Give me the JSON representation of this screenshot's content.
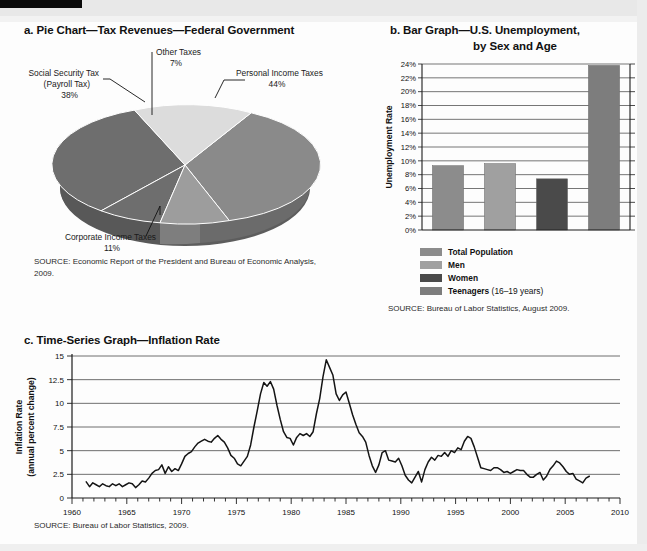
{
  "page": {
    "background": "#ffffff",
    "ink": "#111111"
  },
  "pie": {
    "caption": "a. Pie Chart—Tax Revenues—Federal Government",
    "source": "SOURCE: Economic Report of the President and Bureau of Economic Analysis, 2009.",
    "labels": {
      "personal_name": "Personal Income Taxes",
      "personal_pct": "44%",
      "social_name_line1": "Social Security Tax",
      "social_name_line2": "(Payroll Tax)",
      "social_pct": "38%",
      "corporate_name": "Corporate Income Taxes",
      "corporate_pct": "11%",
      "other_name": "Other Taxes",
      "other_pct": "7%"
    }
  },
  "bar": {
    "caption_line1": "b. Bar Graph—U.S. Unemployment,",
    "caption_line2": "by Sex and Age",
    "source": "SOURCE: Bureau of Labor Statistics, August 2009.",
    "legend": [
      {
        "label": "Total Population",
        "sub": "",
        "color": "#8c8c8c"
      },
      {
        "label": "Men",
        "sub": "",
        "color": "#a0a0a0"
      },
      {
        "label": "Women",
        "sub": "",
        "color": "#4a4a4a"
      },
      {
        "label": "Teenagers",
        "sub": " (16–19 years)",
        "color": "#7d7d7d"
      }
    ]
  },
  "timeseries": {
    "caption": "c. Time-Series Graph—Inflation Rate",
    "source": "SOURCE: Bureau of Labor Statistics, 2009.",
    "ylabel_line1": "Inflation Rate",
    "ylabel_line2": "(annual percent change)"
  },
  "chart_data": [
    {
      "type": "pie",
      "title": "Pie Chart—Tax Revenues—Federal Government",
      "labels": [
        "Personal Income Taxes",
        "Social Security Tax (Payroll Tax)",
        "Corporate Income Taxes",
        "Other Taxes"
      ],
      "values": [
        44,
        38,
        11,
        7
      ],
      "unit": "percent",
      "colors": [
        "#8a8a8a",
        "#6e6e6e",
        "#9c9c9c",
        "#d8d8d8"
      ],
      "legend": "callout-labels",
      "three_d": true
    },
    {
      "type": "bar",
      "title": "Bar Graph—U.S. Unemployment, by Sex and Age",
      "categories": [
        "Total Population",
        "Men",
        "Women",
        "Teenagers (16–19 years)"
      ],
      "values": [
        9.3,
        9.6,
        7.4,
        23.8
      ],
      "xlabel": "",
      "ylabel": "Unemployment Rate",
      "ylim": [
        0,
        24
      ],
      "ytick_labels": [
        "0%",
        "2%",
        "4%",
        "6%",
        "8%",
        "10%",
        "12%",
        "14%",
        "16%",
        "18%",
        "20%",
        "22%",
        "24%"
      ],
      "ytick_values": [
        0,
        2,
        4,
        6,
        8,
        10,
        12,
        14,
        16,
        18,
        20,
        22,
        24
      ],
      "grid": true,
      "legend": "below",
      "series_colors": [
        "#8c8c8c",
        "#a0a0a0",
        "#4a4a4a",
        "#7d7d7d"
      ]
    },
    {
      "type": "line",
      "title": "Time-Series Graph—Inflation Rate",
      "xlabel": "",
      "ylabel": "Inflation Rate (annual percent change)",
      "xlim": [
        1960,
        2010
      ],
      "ylim": [
        0,
        15
      ],
      "xtick_labels": [
        "1960",
        "1965",
        "1970",
        "1975",
        "1980",
        "1985",
        "1990",
        "1995",
        "2000",
        "2005",
        "2010"
      ],
      "xtick_values": [
        1960,
        1965,
        1970,
        1975,
        1980,
        1985,
        1990,
        1995,
        2000,
        2005,
        2010
      ],
      "ytick_labels": [
        "0",
        "2.5",
        "5",
        "7.5",
        "10",
        "12.5",
        "15"
      ],
      "ytick_values": [
        0,
        2.5,
        5,
        7.5,
        10,
        12.5,
        15
      ],
      "grid": true,
      "series": [
        {
          "name": "Inflation Rate (annual percent change)",
          "x": [
            1961.3,
            1961.6,
            1961.9,
            1962.2,
            1962.5,
            1962.8,
            1963.1,
            1963.4,
            1963.7,
            1964.0,
            1964.3,
            1964.6,
            1964.9,
            1965.2,
            1965.5,
            1965.8,
            1966.1,
            1966.4,
            1966.7,
            1967.0,
            1967.3,
            1967.6,
            1967.9,
            1968.2,
            1968.5,
            1968.8,
            1969.1,
            1969.4,
            1969.7,
            1970.0,
            1970.3,
            1970.6,
            1970.9,
            1971.2,
            1971.5,
            1971.8,
            1972.1,
            1972.4,
            1972.7,
            1973.0,
            1973.3,
            1973.6,
            1973.9,
            1974.2,
            1974.5,
            1974.8,
            1975.1,
            1975.4,
            1975.7,
            1976.0,
            1976.3,
            1976.6,
            1976.9,
            1977.2,
            1977.5,
            1977.8,
            1978.1,
            1978.4,
            1978.7,
            1979.0,
            1979.3,
            1979.6,
            1979.9,
            1980.2,
            1980.5,
            1980.8,
            1981.1,
            1981.4,
            1981.7,
            1982.0,
            1982.3,
            1982.6,
            1982.9,
            1983.2,
            1983.5,
            1983.8,
            1984.1,
            1984.4,
            1984.7,
            1985.0,
            1985.3,
            1985.6,
            1985.9,
            1986.2,
            1986.5,
            1986.8,
            1987.1,
            1987.4,
            1987.7,
            1988.0,
            1988.3,
            1988.6,
            1988.9,
            1989.2,
            1989.5,
            1989.8,
            1990.1,
            1990.4,
            1990.7,
            1991.0,
            1991.3,
            1991.6,
            1991.9,
            1992.2,
            1992.5,
            1992.8,
            1993.1,
            1993.4,
            1993.7,
            1994.0,
            1994.3,
            1994.6,
            1994.9,
            1995.2,
            1995.5,
            1995.8,
            1996.1,
            1996.4,
            1996.7,
            1997.0,
            1997.3,
            1997.6,
            1997.9,
            1998.2,
            1998.5,
            1998.8,
            1999.1,
            1999.4,
            1999.7,
            2000.0,
            2000.3,
            2000.6,
            2000.9,
            2001.2,
            2001.5,
            2001.8,
            2002.1,
            2002.4,
            2002.7,
            2003.0,
            2003.3,
            2003.6,
            2003.9,
            2004.2,
            2004.5,
            2004.8,
            2005.1,
            2005.4,
            2005.7,
            2006.0,
            2006.3,
            2006.6,
            2006.9,
            2007.2
          ],
          "y": [
            1.7,
            1.2,
            1.6,
            1.4,
            1.2,
            1.5,
            1.3,
            1.2,
            1.5,
            1.3,
            1.5,
            1.2,
            1.4,
            1.6,
            1.5,
            1.1,
            1.4,
            1.8,
            1.7,
            2.1,
            2.6,
            2.9,
            3.0,
            3.5,
            2.6,
            3.3,
            2.8,
            3.1,
            2.9,
            3.6,
            4.4,
            4.7,
            4.9,
            5.4,
            5.8,
            6.0,
            6.2,
            6.0,
            5.9,
            6.3,
            6.6,
            6.2,
            5.9,
            5.3,
            4.5,
            4.2,
            3.6,
            3.4,
            3.9,
            4.4,
            5.6,
            7.5,
            9.2,
            11.0,
            12.2,
            11.8,
            12.3,
            11.5,
            9.8,
            8.3,
            7.0,
            6.4,
            6.3,
            5.6,
            6.4,
            6.8,
            6.6,
            6.8,
            6.5,
            7.0,
            8.9,
            10.5,
            12.8,
            14.6,
            13.8,
            13.0,
            11.0,
            10.3,
            10.9,
            11.2,
            10.0,
            8.8,
            7.8,
            6.9,
            6.5,
            5.9,
            4.5,
            3.4,
            2.7,
            3.5,
            4.8,
            5.0,
            4.0,
            3.9,
            3.8,
            4.2,
            3.4,
            2.4,
            1.9,
            1.6,
            2.2,
            2.8,
            1.7,
            3.0,
            3.8,
            4.3,
            4.0,
            4.5,
            4.4,
            4.8,
            4.4,
            5.0,
            4.8,
            5.3,
            5.1,
            6.0,
            6.5,
            6.3,
            5.4,
            4.3,
            3.2,
            3.1,
            3.0,
            2.9,
            3.2,
            3.2,
            3.0,
            2.7,
            2.8,
            2.6,
            2.8,
            3.0,
            2.9,
            2.9,
            2.5,
            2.2,
            2.2,
            2.5,
            2.7,
            1.9,
            2.3,
            3.0,
            3.4,
            3.9,
            3.7,
            3.3,
            2.8,
            2.5,
            2.6,
            2.0,
            1.8,
            1.6,
            2.1,
            2.3,
            2.6,
            2.9,
            3.0,
            3.3,
            3.1,
            3.4,
            3.3,
            3.2,
            2.9,
            2.7,
            2.6
          ]
        }
      ]
    }
  ]
}
